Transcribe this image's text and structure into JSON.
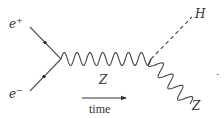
{
  "diagram": {
    "particles": {
      "positron": {
        "label": "e",
        "superscript": "+"
      },
      "electron": {
        "label": "e",
        "superscript": "−"
      },
      "z_propagator": {
        "label": "Z"
      },
      "higgs": {
        "label": "H"
      },
      "z_outgoing": {
        "label": "Z"
      }
    },
    "time_arrow": {
      "label": "time"
    },
    "trailing_mark": "."
  }
}
